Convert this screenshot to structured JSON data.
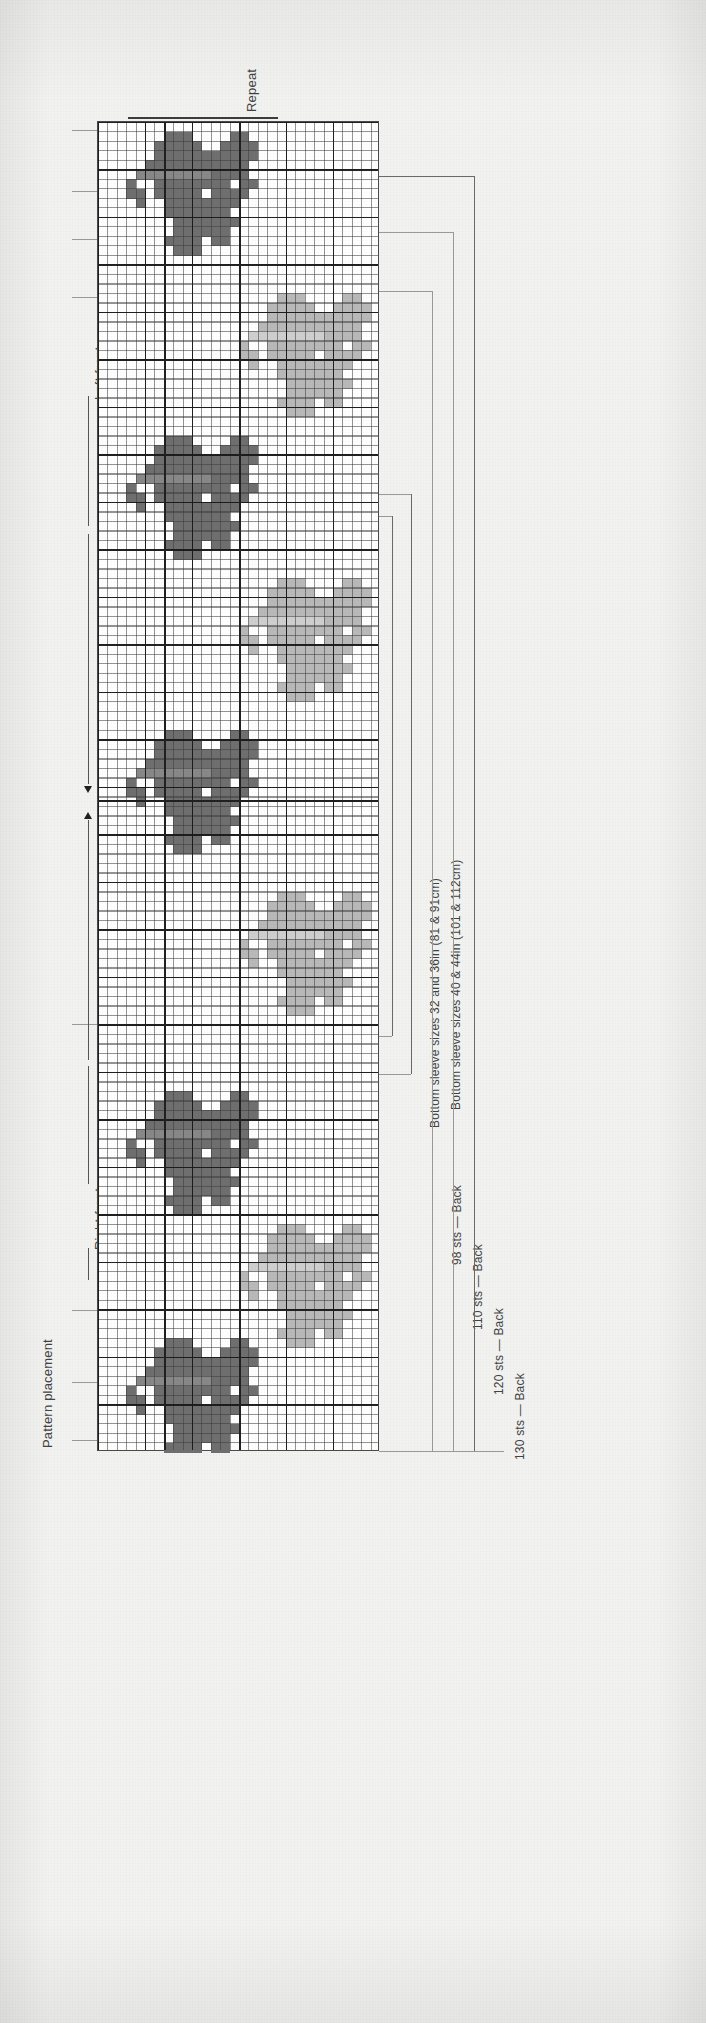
{
  "figure": {
    "kind": "knitting-colourwork-chart",
    "background_color": "#f2f2f0",
    "grid_color": "#4a4a4a"
  },
  "labels": {
    "repeat": "Repeat",
    "left_front": "Left front",
    "right_front": "Right front",
    "pattern_placement": "Pattern placement",
    "bottom_sleeve_small": "Bottom sleeve sizes 32 and 36in (81 & 91cm)",
    "bottom_sleeve_large": "Bottom sleeve sizes 40 & 44in (101 & 112cm)"
  },
  "stitch_counts": [
    {
      "count": "98 sts",
      "dash": "—",
      "piece": "Back"
    },
    {
      "count": "110 sts",
      "dash": "—",
      "piece": "Back"
    },
    {
      "count": "120 sts",
      "dash": "—",
      "piece": "Back"
    },
    {
      "count": "130 sts",
      "dash": "—",
      "piece": "Back"
    }
  ],
  "chart_data": {
    "type": "heatmap",
    "title": "Pattern placement",
    "xlabel": "",
    "ylabel": "",
    "grid": true,
    "legend": "none",
    "columns": 30,
    "rows": 140,
    "bold_grid_every": 5,
    "colors": {
      "background": "#ffffff",
      "dark": "#6f6f6f",
      "mid": "#888888",
      "light": "#b9b9b9",
      "extra_light": "#cfcfcf",
      "grid_fine": "#3c3c3c",
      "grid_bold": "#191919"
    },
    "motifs": [
      {
        "name": "butterfly-1",
        "shade": "dark",
        "col": 3,
        "row": 1,
        "w": 14,
        "h": 13
      },
      {
        "name": "butterfly-2",
        "shade": "light",
        "col": 15,
        "row": 18,
        "w": 14,
        "h": 13
      },
      {
        "name": "butterfly-3",
        "shade": "dark",
        "col": 3,
        "row": 33,
        "w": 14,
        "h": 13
      },
      {
        "name": "butterfly-4",
        "shade": "light",
        "col": 15,
        "row": 48,
        "w": 14,
        "h": 13
      },
      {
        "name": "butterfly-5",
        "shade": "dark",
        "col": 3,
        "row": 64,
        "w": 14,
        "h": 13
      },
      {
        "name": "butterfly-6",
        "shade": "light",
        "col": 15,
        "row": 81,
        "w": 14,
        "h": 13
      },
      {
        "name": "butterfly-7",
        "shade": "dark",
        "col": 3,
        "row": 102,
        "w": 14,
        "h": 13
      },
      {
        "name": "butterfly-8",
        "shade": "light",
        "col": 15,
        "row": 116,
        "w": 14,
        "h": 13
      },
      {
        "name": "butterfly-9",
        "shade": "dark",
        "col": 3,
        "row": 128,
        "w": 14,
        "h": 13
      }
    ]
  }
}
